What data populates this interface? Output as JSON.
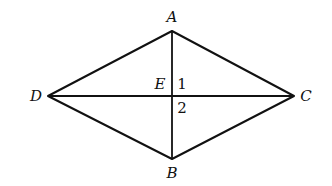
{
  "diagram": {
    "type": "rhombus with diagonals",
    "vertices": {
      "A": {
        "label": "A",
        "x": 172,
        "y": 31
      },
      "B": {
        "label": "B",
        "x": 172,
        "y": 159
      },
      "C": {
        "label": "C",
        "x": 294,
        "y": 96
      },
      "D": {
        "label": "D",
        "x": 48,
        "y": 96
      },
      "E": {
        "label": "E",
        "x": 172,
        "y": 96
      }
    },
    "edges": [
      [
        "A",
        "C"
      ],
      [
        "C",
        "B"
      ],
      [
        "B",
        "D"
      ],
      [
        "D",
        "A"
      ]
    ],
    "diagonals": [
      [
        "A",
        "B"
      ],
      [
        "D",
        "C"
      ]
    ],
    "angle_labels": {
      "angle1": "1",
      "angle2": "2"
    },
    "colors": {
      "stroke": "#111111",
      "background": "#ffffff"
    }
  }
}
